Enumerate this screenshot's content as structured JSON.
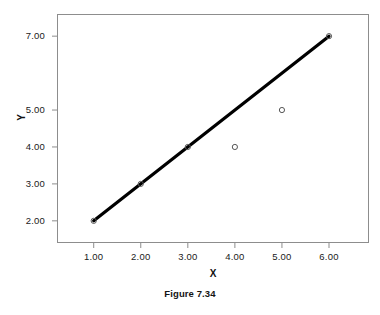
{
  "figure": {
    "caption": "Figure 7.34"
  },
  "chart_data": {
    "type": "scatter",
    "title": "",
    "xlabel": "X",
    "ylabel": "Y",
    "x": [
      1,
      2,
      3,
      4,
      5,
      6
    ],
    "values": [
      2,
      3,
      4,
      4,
      5,
      7
    ],
    "series": [
      {
        "name": "observed",
        "type": "scatter",
        "marker": "open-circle",
        "points": [
          {
            "x": 1,
            "y": 2
          },
          {
            "x": 2,
            "y": 3
          },
          {
            "x": 3,
            "y": 4
          },
          {
            "x": 4,
            "y": 4
          },
          {
            "x": 5,
            "y": 5
          },
          {
            "x": 6,
            "y": 7
          }
        ]
      },
      {
        "name": "fitted-line",
        "type": "line",
        "color": "#000000",
        "points": [
          {
            "x": 1,
            "y": 2
          },
          {
            "x": 6,
            "y": 7
          }
        ]
      }
    ],
    "xtick_labels": [
      "1.00",
      "2.00",
      "3.00",
      "4.00",
      "5.00",
      "6.00"
    ],
    "xtick_values": [
      1,
      2,
      3,
      4,
      5,
      6
    ],
    "ytick_labels": [
      "2.00",
      "3.00",
      "4.00",
      "5.00",
      "7.00"
    ],
    "ytick_values": [
      2,
      3,
      4,
      5,
      7
    ],
    "xlim": [
      0.22,
      6.85
    ],
    "ylim": [
      1.4,
      7.6
    ],
    "grid": false,
    "legend": null,
    "frame": true,
    "line_color": "#000000",
    "marker_edge_color": "#555555",
    "axis_color": "#8d8d8d"
  }
}
